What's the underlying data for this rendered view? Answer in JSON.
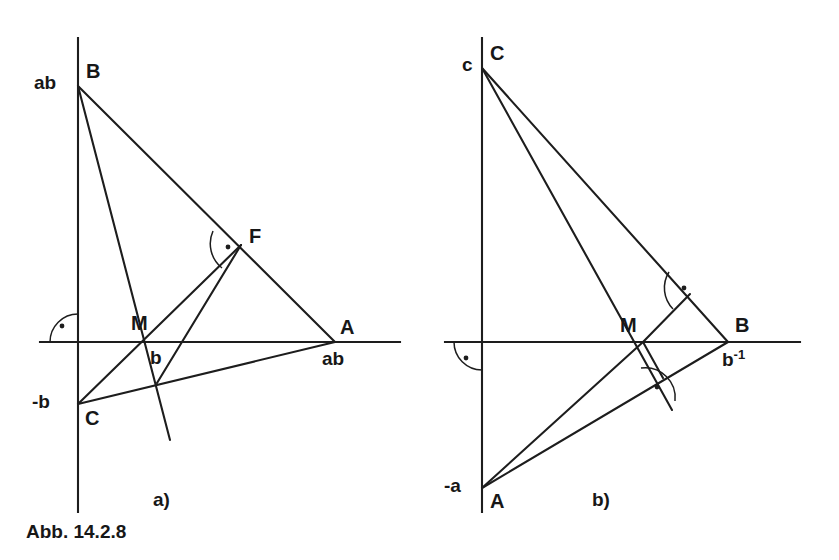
{
  "figure": {
    "caption": "Abb. 14.2.8",
    "stroke_color": "#1d1d1d",
    "background_color": "#ffffff",
    "panels": [
      {
        "id": "a",
        "label": "a)",
        "points": [
          {
            "name": "B",
            "vertex_label": "B",
            "value_label": "ab",
            "x": 78,
            "y": 86
          },
          {
            "name": "M",
            "vertex_label": "M",
            "value_label": "b",
            "x": 145,
            "y": 342
          },
          {
            "name": "A",
            "vertex_label": "A",
            "value_label": "ab",
            "x": 335,
            "y": 342
          },
          {
            "name": "C",
            "vertex_label": "C",
            "value_label": "-b",
            "x": 78,
            "y": 404
          },
          {
            "name": "F",
            "vertex_label": "F",
            "value_label": "",
            "x": 241,
            "y": 245
          }
        ],
        "right_angles": [
          "origin-axes",
          "at-F",
          "at-foot-on-CA"
        ]
      },
      {
        "id": "b",
        "label": "b)",
        "points": [
          {
            "name": "C",
            "vertex_label": "C",
            "value_label": "c",
            "x": 482,
            "y": 68
          },
          {
            "name": "M",
            "vertex_label": "M",
            "value_label": "",
            "x": 643,
            "y": 342
          },
          {
            "name": "B",
            "vertex_label": "B",
            "value_label": "b^-1",
            "x": 728,
            "y": 342
          },
          {
            "name": "A",
            "vertex_label": "A",
            "value_label": "-a",
            "x": 482,
            "y": 488
          }
        ],
        "b_inverse_base": "b",
        "b_inverse_exponent": "-1",
        "right_angles": [
          "origin-axes",
          "at-foot-on-CB",
          "at-foot-on-AB"
        ]
      }
    ]
  }
}
